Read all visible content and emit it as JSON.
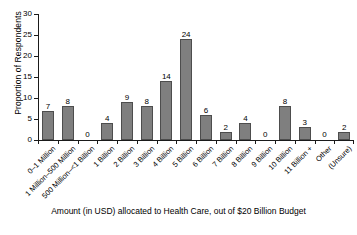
{
  "chart_data": {
    "type": "bar",
    "title": "",
    "xlabel": "Amount (in USD) allocated to Health Care, out of $20 Billion Budget",
    "ylabel": "Proportion of Respondents",
    "ylim": [
      0,
      30
    ],
    "yticks": [
      0,
      5,
      10,
      15,
      20,
      25,
      30
    ],
    "grid": false,
    "legend": "none",
    "categories": [
      "0–1 Million",
      "1 Million–500 Million",
      "500 Million–<1 Billion",
      "1 Billion",
      "2 Billion",
      "3 Billion",
      "4 Billion",
      "5 Billion",
      "6 Billion",
      "7 Billion",
      "8 Billion",
      "9 Billion",
      "10 Billion",
      "11 Billion +",
      "Other",
      "(Unsure)"
    ],
    "values": [
      7,
      8,
      0,
      4,
      9,
      8,
      14,
      24,
      6,
      2,
      4,
      0,
      8,
      3,
      0,
      2
    ]
  },
  "axes": {
    "y_title": "Proportion of Respondents",
    "tick_labels": [
      "0",
      "5",
      "10",
      "15",
      "20",
      "25",
      "30"
    ]
  },
  "caption": {
    "line1": "Amount (in USD) allocated to Health Care, out of $20 Billion Budget",
    "line2": "(clipped second line)"
  },
  "style": {
    "bar_fill": "#7f7f7f",
    "bar_stroke": "#4d4d4d",
    "axis_color": "#1a1a1a",
    "background": "#ffffff"
  }
}
